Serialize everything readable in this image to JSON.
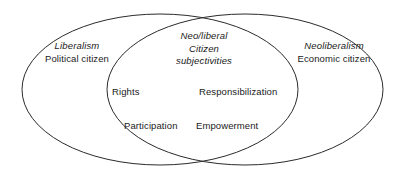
{
  "figure": {
    "type": "venn-diagram",
    "background_color": "#ffffff",
    "stroke_color": "#2b2b2b",
    "text_color": "#1a1a1a"
  },
  "left_set": {
    "name": "Liberalism",
    "subtitle": "Political citizen"
  },
  "right_set": {
    "name": "Neoliberalism",
    "subtitle": "Economic citizen"
  },
  "intersection": {
    "heading_line1": "Neo/liberal",
    "heading_line2": "Citizen",
    "heading_line3": "subjectivities",
    "terms": {
      "rights": "Rights",
      "responsibilization": "Responsibilization",
      "participation": "Participation",
      "empowerment": "Empowerment"
    }
  }
}
